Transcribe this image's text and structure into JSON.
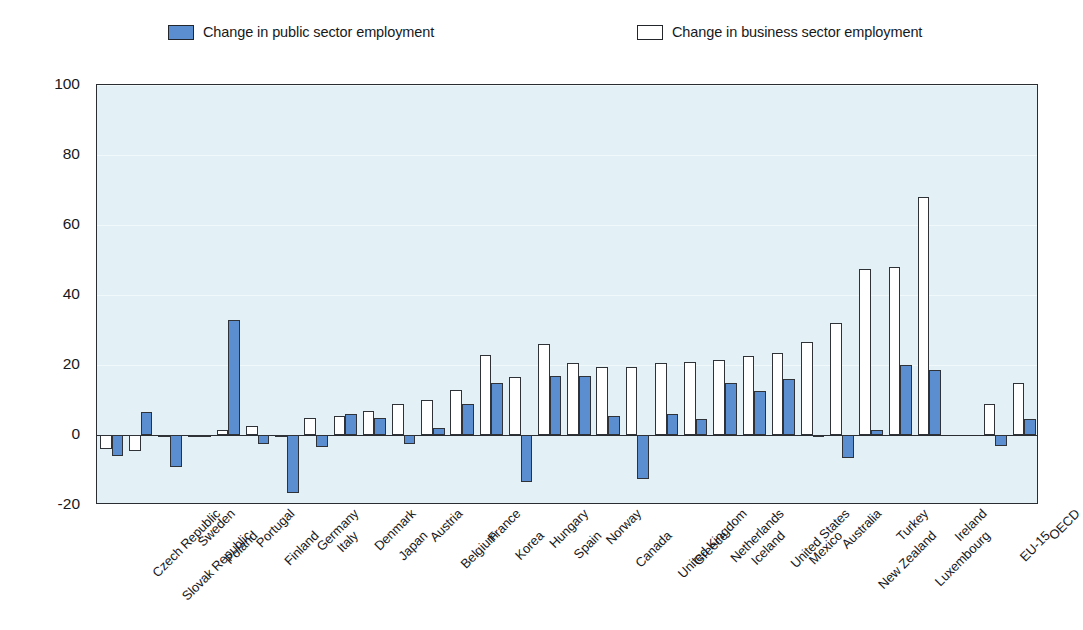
{
  "legend": {
    "entries": [
      {
        "key": "public",
        "label": "Change in public sector employment",
        "swatch": "filled-square-icon",
        "color": "#5b8ed0"
      },
      {
        "key": "business",
        "label": "Change in business sector employment",
        "swatch": "hollow-square-icon",
        "color": "#ffffff"
      }
    ]
  },
  "axis": {
    "y_ticks": [
      "100",
      "80",
      "60",
      "40",
      "20",
      "0",
      "-20"
    ]
  },
  "chart_data": {
    "type": "bar",
    "title": "",
    "xlabel": "",
    "ylabel": "",
    "ylim": [
      -20,
      100
    ],
    "yticks": [
      -20,
      0,
      20,
      40,
      60,
      80,
      100
    ],
    "grid": true,
    "legend_position": "top",
    "categories": [
      "Czech Republic",
      "Slovak Republic",
      "Sweden",
      "Poland",
      "Portugal",
      "Finland",
      "Germany",
      "Italy",
      "Denmark",
      "Japan",
      "Austria",
      "Belgium",
      "France",
      "Korea",
      "Hungary",
      "Spain",
      "Norway",
      "Canada",
      "United Kingdom",
      "Greece",
      "Netherlands",
      "Iceland",
      "United States",
      "Mexico",
      "Australia",
      "New Zealand",
      "Turkey",
      "Luxembourg",
      "Ireland",
      "EU-15",
      "OECD"
    ],
    "series": [
      {
        "name": "Change in public sector employment",
        "color": "#5b8ed0",
        "values": [
          -6.0,
          6.5,
          -9.0,
          -0.5,
          33.0,
          -2.5,
          -16.5,
          -3.5,
          6.0,
          5.0,
          -2.5,
          2.0,
          9.0,
          15.0,
          -13.5,
          17.0,
          17.0,
          5.5,
          -12.5,
          6.0,
          4.5,
          15.0,
          12.5,
          16.0,
          -0.5,
          -6.5,
          1.5,
          20.0,
          18.5,
          -3.0,
          4.5
        ]
      },
      {
        "name": "Change in business sector employment",
        "color": "#ffffff",
        "values": [
          -4.0,
          -4.5,
          0.0,
          -0.5,
          1.5,
          2.5,
          0.0,
          5.0,
          5.5,
          7.0,
          9.0,
          10.0,
          13.0,
          23.0,
          16.5,
          26.0,
          20.5,
          19.5,
          19.5,
          20.5,
          21.0,
          21.5,
          22.5,
          23.5,
          26.5,
          32.0,
          47.5,
          48.0,
          68.0,
          9.0,
          15.0
        ]
      }
    ],
    "group_gap_note": "EU-15 and OECD separated from country series by a gap"
  }
}
